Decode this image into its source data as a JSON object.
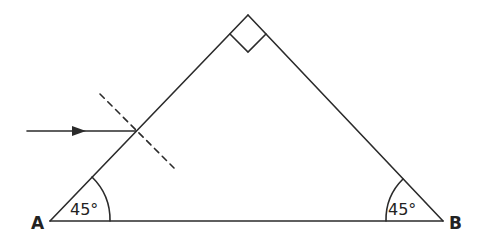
{
  "diagram": {
    "type": "prism ray diagram",
    "colors": {
      "stroke": "#2b2b2b",
      "text": "#222222",
      "background": "#ffffff"
    },
    "triangle": {
      "vertices": {
        "A": {
          "label": "A",
          "x": 50,
          "y": 221
        },
        "B": {
          "label": "B",
          "x": 443,
          "y": 221
        },
        "apex": {
          "x": 248,
          "y": 15
        }
      },
      "right_angle_marker": true
    },
    "angles": {
      "A": {
        "label": "45°"
      },
      "B": {
        "label": "45°"
      }
    },
    "incident_ray": {
      "from": [
        27,
        131
      ],
      "to": [
        136,
        131
      ],
      "arrow": true
    },
    "normal": {
      "style": "dashed",
      "from": [
        100,
        94
      ],
      "to": [
        174,
        168
      ]
    }
  }
}
